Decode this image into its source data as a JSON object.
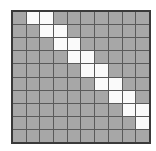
{
  "grid": {
    "rows": 10,
    "cols": 10,
    "colors": {
      "filled": "#a7a7a7",
      "highlight": "#fafafa",
      "line": "#5a5a5a",
      "border": "#3a3a3a"
    },
    "highlighted_cells": [
      [
        0,
        1
      ],
      [
        0,
        2
      ],
      [
        1,
        2
      ],
      [
        1,
        3
      ],
      [
        2,
        3
      ],
      [
        2,
        4
      ],
      [
        3,
        4
      ],
      [
        3,
        5
      ],
      [
        4,
        5
      ],
      [
        4,
        6
      ],
      [
        5,
        6
      ],
      [
        5,
        7
      ],
      [
        6,
        7
      ],
      [
        6,
        8
      ],
      [
        7,
        8
      ],
      [
        7,
        9
      ],
      [
        8,
        9
      ]
    ]
  }
}
